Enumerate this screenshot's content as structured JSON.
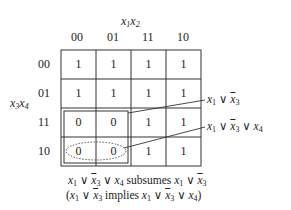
{
  "kmap": {
    "col_var_label": [
      "x",
      "1",
      "x",
      "2"
    ],
    "row_var_label": [
      "x",
      "3",
      "x",
      "4"
    ],
    "col_headers": [
      "00",
      "01",
      "11",
      "10"
    ],
    "row_headers": [
      "00",
      "01",
      "11",
      "10"
    ],
    "cells": [
      [
        "1",
        "1",
        "1",
        "1"
      ],
      [
        "1",
        "1",
        "1",
        "1"
      ],
      [
        "0",
        "0",
        "1",
        "1"
      ],
      [
        "0",
        "0",
        "1",
        "1"
      ]
    ]
  },
  "annotations": {
    "solid_group": {
      "v1": "x",
      "s1": "1",
      "op1": "∨",
      "v2": "x",
      "s2": "3"
    },
    "dotted_group": {
      "v1": "x",
      "s1": "1",
      "op1": "∨",
      "v2": "x",
      "s2": "3",
      "op2": "∨",
      "v3": "x",
      "s3": "4"
    }
  },
  "caption": {
    "line1": {
      "a": "x",
      "as": "1",
      "op1": "∨",
      "b": "x",
      "bs": "3",
      "op2": "∨",
      "c": "x",
      "cs": "4",
      "word": "subsumes",
      "d": "x",
      "ds": "1",
      "op3": "∨",
      "e": "x",
      "es": "3"
    },
    "line2": {
      "open": "(",
      "a": "x",
      "as": "1",
      "op1": "∨",
      "b": "x",
      "bs": "3",
      "word": "implies",
      "c": "x",
      "cs": "1",
      "op2": "∨",
      "d": "x",
      "ds": "3",
      "op3": "∨",
      "e": "x",
      "es": "4",
      "close": ")"
    }
  }
}
